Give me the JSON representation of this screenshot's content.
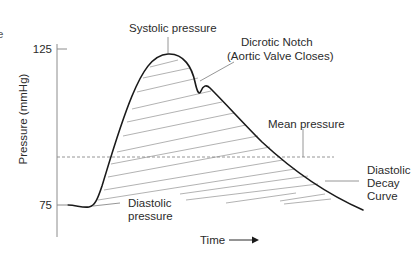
{
  "figure": {
    "edge_fragment": "e",
    "y_axis": {
      "label": "Pressure (mmHg)",
      "ticks": [
        {
          "value": "125",
          "y": 49
        },
        {
          "value": "75",
          "y": 205
        }
      ]
    },
    "x_axis": {
      "label": "Time",
      "arrow": "right-arrow"
    },
    "annotations": {
      "systolic": "Systolic pressure",
      "dicrotic_line1": "Dicrotic Notch",
      "dicrotic_line2": "(Aortic Valve Closes)",
      "mean": "Mean pressure",
      "diastolic_line1": "Diastolic",
      "diastolic_line2": "pressure",
      "decay_line1": "Diastolic",
      "decay_line2": "Decay",
      "decay_line3": "Curve"
    },
    "colors": {
      "curve": "#1a1a1a",
      "axis": "#888888",
      "hatch": "#a8a8a8",
      "leader": "#8a8a8a",
      "dashed": "#8a8a8a"
    }
  }
}
